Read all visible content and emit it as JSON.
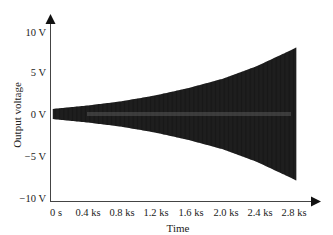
{
  "chart_data": {
    "type": "line",
    "title": "",
    "xlabel": "Time",
    "ylabel": "Output voltage",
    "x_ticks": [
      "0 s",
      "0.4 ks",
      "0.8 ks",
      "1.2 ks",
      "1.6 ks",
      "2.0 ks",
      "2.4 ks",
      "2.8 ks"
    ],
    "y_ticks": [
      "10 V",
      "5 V",
      "0 V",
      "−5 V",
      "−10 V"
    ],
    "xlim": [
      0,
      2.9
    ],
    "ylim": [
      -10,
      10
    ],
    "x_unit": "ks",
    "y_unit": "V",
    "grid": false,
    "legend": null,
    "envelope": {
      "x_ks": [
        0,
        0.4,
        0.8,
        1.2,
        1.6,
        2.0,
        2.4,
        2.8,
        2.9
      ],
      "amplitude_V": [
        0.6,
        1.0,
        1.5,
        2.2,
        3.1,
        4.2,
        5.7,
        7.6,
        8.1
      ]
    },
    "colors": {
      "signal": "#1a1a1a",
      "axis": "#333333"
    }
  }
}
